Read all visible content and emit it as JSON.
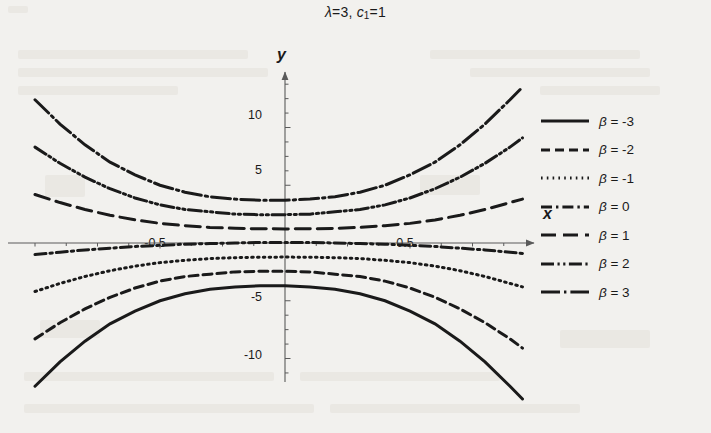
{
  "figure": {
    "title_plain": "λ=3, c1=1",
    "title_lambda": "λ",
    "title_lambda_value": "=3,",
    "title_c": "c",
    "title_c_sub": "1",
    "title_c_value": "=1",
    "x_axis_label": "x",
    "y_axis_label": "y",
    "background_color": "#f2f1ee",
    "line_color": "#1a1a1a",
    "axis_color": "#5a5a5a"
  },
  "chart_data": {
    "type": "line",
    "xlabel": "x",
    "ylabel": "y",
    "xlim": [
      -1.03,
      0.98
    ],
    "ylim": [
      -12.5,
      12.3
    ],
    "xticks": [
      -0.5,
      0.5
    ],
    "xtick_labels": [
      "-0.5",
      "0.5"
    ],
    "yticks": [
      -10,
      -5,
      5,
      10
    ],
    "ytick_labels": [
      "-10",
      "-5",
      "5",
      "10"
    ],
    "grid": false,
    "legend_position": "right",
    "axes_style": "centered-arrows",
    "x": [
      -1.0,
      -0.9,
      -0.8,
      -0.7,
      -0.6,
      -0.5,
      -0.4,
      -0.3,
      -0.2,
      -0.1,
      0.0,
      0.1,
      0.2,
      0.3,
      0.4,
      0.5,
      0.6,
      0.7,
      0.8,
      0.9,
      0.95
    ],
    "series": [
      {
        "name": "β = -3",
        "beta": -3,
        "dash": "solid",
        "values": [
          -12.4,
          -10.3,
          -8.5,
          -7.0,
          -5.9,
          -5.0,
          -4.4,
          -4.0,
          -3.8,
          -3.7,
          -3.7,
          -3.8,
          -4.0,
          -4.4,
          -5.0,
          -5.9,
          -7.0,
          -8.5,
          -10.3,
          -12.4,
          -13.5
        ]
      },
      {
        "name": "β = -2",
        "beta": -2,
        "dash": "dashed",
        "values": [
          -8.3,
          -6.9,
          -5.7,
          -4.7,
          -3.9,
          -3.3,
          -2.9,
          -2.7,
          -2.5,
          -2.45,
          -2.45,
          -2.5,
          -2.7,
          -2.9,
          -3.3,
          -3.9,
          -4.7,
          -5.7,
          -6.9,
          -8.3,
          -9.1
        ]
      },
      {
        "name": "β = -1",
        "beta": -1,
        "dash": "dotted",
        "values": [
          -4.2,
          -3.5,
          -2.9,
          -2.4,
          -2.0,
          -1.7,
          -1.5,
          -1.35,
          -1.27,
          -1.23,
          -1.22,
          -1.23,
          -1.27,
          -1.35,
          -1.5,
          -1.7,
          -2.0,
          -2.4,
          -2.9,
          -3.5,
          -3.8
        ]
      },
      {
        "name": "β = 0",
        "beta": 0,
        "dash": "dashdot",
        "values": [
          -1.0,
          -0.8,
          -0.6,
          -0.45,
          -0.3,
          -0.2,
          -0.1,
          -0.05,
          0.0,
          0.05,
          0.05,
          0.05,
          0.0,
          -0.05,
          -0.1,
          -0.2,
          -0.3,
          -0.45,
          -0.6,
          -0.8,
          -0.9
        ]
      },
      {
        "name": "β = 1",
        "beta": 1,
        "dash": "longdash",
        "values": [
          4.2,
          3.5,
          2.9,
          2.4,
          2.0,
          1.7,
          1.5,
          1.35,
          1.27,
          1.23,
          1.22,
          1.23,
          1.27,
          1.35,
          1.5,
          1.7,
          2.0,
          2.4,
          2.9,
          3.5,
          3.8
        ]
      },
      {
        "name": "β = 2",
        "beta": 2,
        "dash": "dashdotdot",
        "values": [
          8.3,
          6.9,
          5.7,
          4.7,
          3.9,
          3.3,
          2.9,
          2.7,
          2.5,
          2.45,
          2.45,
          2.5,
          2.7,
          2.9,
          3.3,
          3.9,
          4.7,
          5.7,
          6.9,
          8.3,
          9.1
        ]
      },
      {
        "name": "β = 3",
        "beta": 3,
        "dash": "longdashdot",
        "values": [
          12.4,
          10.3,
          8.5,
          7.0,
          5.9,
          5.0,
          4.4,
          4.0,
          3.8,
          3.7,
          3.7,
          3.8,
          4.0,
          4.4,
          5.0,
          5.9,
          7.0,
          8.5,
          10.3,
          12.4,
          13.5
        ]
      }
    ]
  },
  "legend": {
    "items": [
      {
        "label": "β = -3",
        "swatch": "solid"
      },
      {
        "label": "β = -2",
        "swatch": "dashed"
      },
      {
        "label": "β = -1",
        "swatch": "dotted"
      },
      {
        "label": "β = 0",
        "swatch": "dashdot"
      },
      {
        "label": "β = 1",
        "swatch": "longdash"
      },
      {
        "label": "β = 2",
        "swatch": "dashdotdot"
      },
      {
        "label": "β = 3",
        "swatch": "longdashdot"
      }
    ]
  },
  "tick_labels": {
    "y_10": "10",
    "y_5": "5",
    "y_neg5": "-5",
    "y_neg10": "-10",
    "x_neg05": "-0.5",
    "x_05": "0.5"
  }
}
